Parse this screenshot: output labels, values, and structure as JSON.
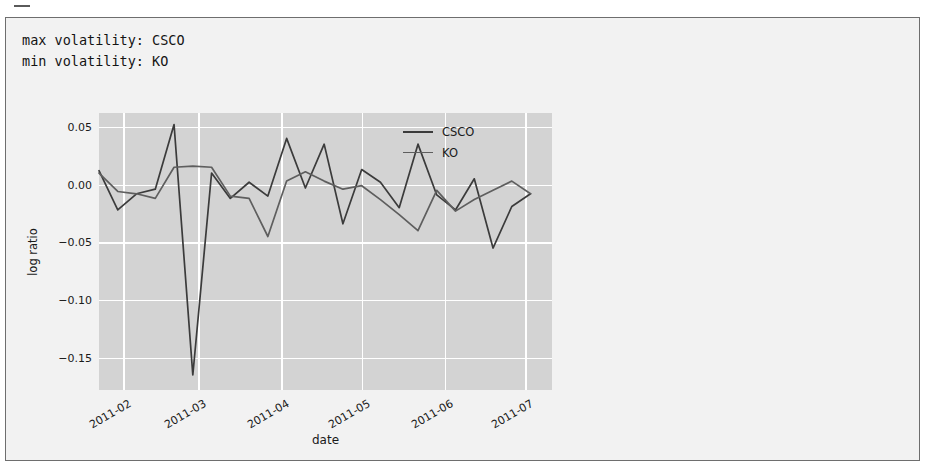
{
  "cell": {
    "stub_label": ""
  },
  "stdout": {
    "lines": [
      "max volatility: CSCO",
      "min volatility: KO"
    ],
    "max_line": "max volatility: CSCO",
    "min_line": "min volatility: KO"
  },
  "colors": {
    "axes_background": "#d3d3d3",
    "figure_background": "#f2f2f2",
    "grid": "#ffffff",
    "frame_border": "#6e6e6e",
    "series_csco": "#3b3b3b",
    "series_ko": "#5e5e5e",
    "text": "#1a1a1a"
  },
  "chart_data": {
    "type": "line",
    "title": "",
    "xlabel": "date",
    "ylabel": "log ratio",
    "grid": true,
    "legend_position": "top-right",
    "ylim": [
      -0.178,
      0.062
    ],
    "yticks": [
      0.05,
      0.0,
      -0.05,
      -0.1,
      -0.15
    ],
    "ytick_labels": [
      "0.05",
      "0.00",
      "−0.05",
      "−0.10",
      "−0.15"
    ],
    "xticks": [
      "2011-02",
      "2011-03",
      "2011-04",
      "2011-05",
      "2011-06",
      "2011-07"
    ],
    "xtick_labels": [
      "2011-02",
      "2011-03",
      "2011-04",
      "2011-05",
      "2011-06",
      "2011-07"
    ],
    "xlim_days": [
      -9,
      160
    ],
    "series": [
      {
        "name": "CSCO",
        "color": "#3b3b3b",
        "x": [
          -9,
          -2,
          5,
          12,
          19,
          26,
          33,
          40,
          47,
          54,
          61,
          68,
          75,
          82,
          89,
          96,
          103,
          110,
          117,
          124,
          131,
          138,
          145,
          152
        ],
        "values": [
          0.012,
          -0.022,
          -0.008,
          -0.004,
          0.052,
          -0.165,
          0.01,
          -0.012,
          0.002,
          -0.01,
          0.04,
          -0.003,
          0.035,
          -0.034,
          0.013,
          0.002,
          -0.02,
          0.035,
          -0.009,
          -0.022,
          0.005,
          -0.055,
          -0.019,
          -0.008
        ]
      },
      {
        "name": "KO",
        "color": "#5e5e5e",
        "x": [
          -9,
          -2,
          5,
          12,
          19,
          26,
          33,
          40,
          47,
          54,
          61,
          68,
          75,
          82,
          89,
          96,
          103,
          110,
          117,
          124,
          131,
          138,
          145,
          152
        ],
        "values": [
          0.01,
          -0.006,
          -0.008,
          -0.012,
          0.015,
          0.016,
          0.015,
          -0.01,
          -0.012,
          -0.045,
          0.003,
          0.011,
          0.003,
          -0.004,
          -0.001,
          -0.013,
          -0.026,
          -0.04,
          -0.005,
          -0.023,
          -0.013,
          -0.005,
          0.003,
          -0.008
        ]
      }
    ]
  },
  "legend": {
    "items": [
      {
        "label": "CSCO"
      },
      {
        "label": "KO"
      }
    ]
  }
}
